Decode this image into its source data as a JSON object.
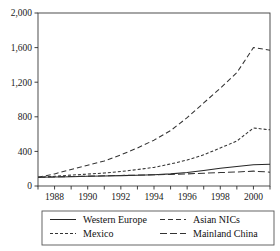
{
  "chart_data": {
    "type": "line",
    "title": "",
    "subtitle": "",
    "xlabel": "",
    "ylabel": "",
    "xlim": [
      1987,
      2001
    ],
    "ylim": [
      0,
      2000
    ],
    "grid": false,
    "legend_position": "bottom",
    "y_ticks": [
      0,
      400,
      800,
      1200,
      1600,
      2000
    ],
    "y_tick_labels": [
      "0",
      "400",
      "800",
      "1,200",
      "1,600",
      "2,000"
    ],
    "x_ticks": [
      1987,
      1988,
      1989,
      1990,
      1991,
      1992,
      1993,
      1994,
      1995,
      1996,
      1997,
      1998,
      1999,
      2000,
      2001
    ],
    "x_tick_labels": [
      "",
      "1988",
      "",
      "1990",
      "",
      "1992",
      "",
      "1994",
      "",
      "1996",
      "",
      "1998",
      "",
      "2000",
      ""
    ],
    "x": [
      1987,
      1988,
      1989,
      1990,
      1991,
      1992,
      1993,
      1994,
      1995,
      1996,
      1997,
      1998,
      1999,
      2000,
      2001
    ],
    "series": [
      {
        "name": "Western Europe",
        "dash": "none",
        "color": "#262626",
        "values": [
          100,
          104,
          108,
          112,
          116,
          120,
          124,
          130,
          140,
          155,
          180,
          205,
          225,
          245,
          252
        ]
      },
      {
        "name": "Mexico",
        "dash": "short",
        "color": "#333333",
        "values": [
          100,
          112,
          126,
          138,
          150,
          168,
          190,
          215,
          255,
          300,
          360,
          440,
          520,
          670,
          650
        ]
      },
      {
        "name": "Asian NICs",
        "dash": "medium",
        "color": "#333333",
        "values": [
          100,
          140,
          190,
          240,
          290,
          360,
          440,
          530,
          640,
          790,
          960,
          1130,
          1310,
          1600,
          1570
        ]
      },
      {
        "name": "Mainland China",
        "dash": "dashdot",
        "color": "#333333",
        "values": [
          100,
          105,
          110,
          114,
          118,
          122,
          126,
          130,
          134,
          140,
          148,
          155,
          162,
          172,
          160
        ]
      }
    ]
  },
  "legend": {
    "entries": [
      {
        "label": "Western Europe"
      },
      {
        "label": "Asian NICs"
      },
      {
        "label": "Mexico"
      },
      {
        "label": "Mainland China"
      }
    ]
  }
}
